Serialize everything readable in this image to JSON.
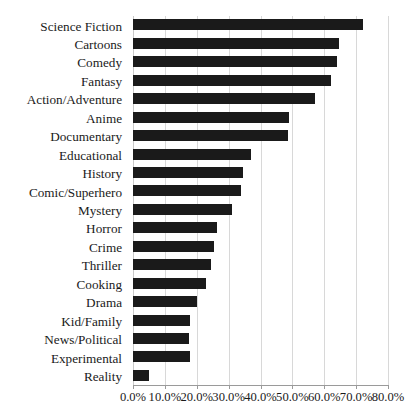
{
  "chart_data": {
    "type": "bar",
    "orientation": "horizontal",
    "title": "",
    "xlabel": "",
    "ylabel": "",
    "xlim": [
      0,
      80
    ],
    "xtick_labels": [
      "0.0%",
      "10.0%",
      "20.0%",
      "30.0%",
      "40.0%",
      "50.0%",
      "60.0%",
      "70.0%",
      "80.0%"
    ],
    "xticks": [
      0,
      10,
      20,
      30,
      40,
      50,
      60,
      70,
      80
    ],
    "grid": true,
    "legend": false,
    "bar_color": "#1a1a1a",
    "categories": [
      "Science Fiction",
      "Cartoons",
      "Comedy",
      "Fantasy",
      "Action/Adventure",
      "Anime",
      "Documentary",
      "Educational",
      "History",
      "Comic/Superhero",
      "Mystery",
      "Horror",
      "Crime",
      "Thriller",
      "Cooking",
      "Drama",
      "Kid/Family",
      "News/Political",
      "Experimental",
      "Reality"
    ],
    "values": [
      72.0,
      64.5,
      64.0,
      62.0,
      57.0,
      49.0,
      48.5,
      37.0,
      34.5,
      34.0,
      31.0,
      26.5,
      25.5,
      24.5,
      23.0,
      20.0,
      18.0,
      17.5,
      18.0,
      5.0
    ]
  }
}
